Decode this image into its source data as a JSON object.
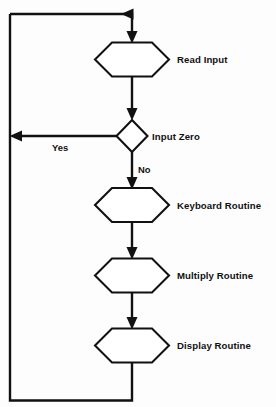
{
  "diagram": {
    "type": "flowchart",
    "background_color": "#fdfdfd",
    "line_color": "#111111",
    "shape_fill": "#ffffff",
    "nodes": [
      {
        "id": "read-input",
        "shape": "hexagon",
        "label": "Read Input",
        "cx": 132,
        "cy": 59.5,
        "half_width": 37,
        "half_height": 17,
        "tip": 17,
        "label_x": 177,
        "label_y": 62.5
      },
      {
        "id": "input-zero",
        "shape": "diamond",
        "label": "Input Zero",
        "cx": 132,
        "cy": 136,
        "half_width": 15,
        "half_height": 16,
        "label_x": 152,
        "label_y": 139.5
      },
      {
        "id": "keyboard-routine",
        "shape": "hexagon",
        "label": "Keyboard Routine",
        "cx": 132,
        "cy": 205,
        "half_width": 37,
        "half_height": 17,
        "tip": 17,
        "label_x": 177,
        "label_y": 208,
        "label_x2": 177,
        "label_y2": 208
      },
      {
        "id": "multiply-routine",
        "shape": "hexagon",
        "label": "Multiply Routine",
        "cx": 132,
        "cy": 275.5,
        "half_width": 37,
        "half_height": 17,
        "tip": 17,
        "label_x": 177,
        "label_y": 278.5
      },
      {
        "id": "display-routine",
        "shape": "hexagon",
        "label": "Display Routine",
        "cx": 132,
        "cy": 345.5,
        "half_width": 37,
        "half_height": 17,
        "tip": 17,
        "label_x": 177,
        "label_y": 348.5
      }
    ],
    "edge_labels": [
      {
        "id": "yes-label",
        "text": "Yes",
        "x": 62,
        "y": 150
      },
      {
        "id": "no-label",
        "text": "No",
        "x": 138,
        "y": 172
      }
    ],
    "connectors": [
      {
        "id": "top-return-to-read-input",
        "points": "10,14 132,14 132,38",
        "arrow": "down"
      },
      {
        "id": "read-input-to-decision",
        "points": "132,76.5 132,115",
        "arrow": "down"
      },
      {
        "id": "decision-yes-to-left-rail",
        "points": "117,136 14,136",
        "arrow": "left"
      },
      {
        "id": "decision-no-to-keyboard",
        "points": "132,152 132,184",
        "arrow": "down"
      },
      {
        "id": "keyboard-to-multiply",
        "points": "132,222 132,254",
        "arrow": "down"
      },
      {
        "id": "multiply-to-display",
        "points": "132,292.5 132,324",
        "arrow": "down"
      },
      {
        "id": "display-to-bottom-rail",
        "points": "132,362.5 132,400 10,400 10,14",
        "arrow": "none"
      }
    ],
    "arrowheads": [
      {
        "id": "arrow-top-right",
        "dir": "right",
        "x": 132,
        "y": 14
      },
      {
        "id": "arrow-into-read-input",
        "dir": "down",
        "x": 132,
        "y": 42
      },
      {
        "id": "arrow-into-decision",
        "dir": "down",
        "x": 132,
        "y": 120
      },
      {
        "id": "arrow-yes-left",
        "dir": "left",
        "x": 10,
        "y": 136
      },
      {
        "id": "arrow-into-keyboard",
        "dir": "down",
        "x": 132,
        "y": 188
      },
      {
        "id": "arrow-into-multiply",
        "dir": "down",
        "x": 132,
        "y": 258
      },
      {
        "id": "arrow-into-display",
        "dir": "down",
        "x": 132,
        "y": 328
      }
    ]
  }
}
